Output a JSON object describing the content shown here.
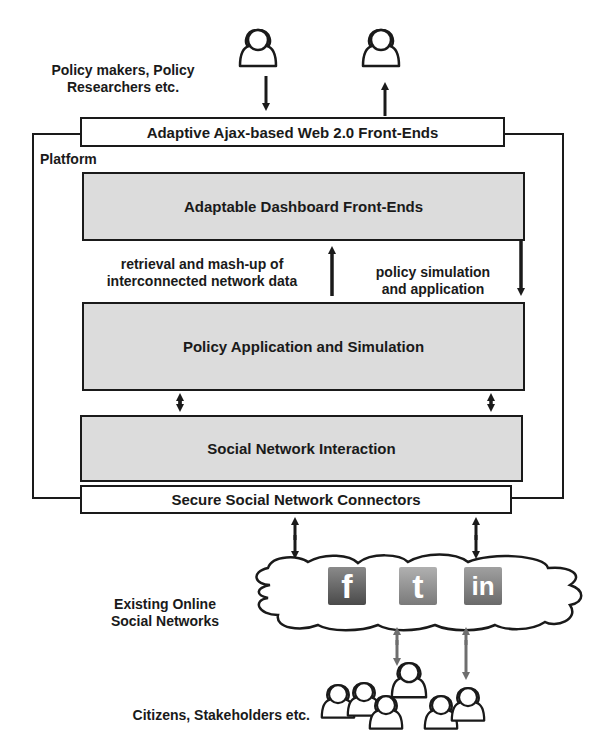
{
  "actors": {
    "top_label": "Policy makers, Policy\nResearchers etc.",
    "top_label_line1": "Policy makers, Policy",
    "top_label_line2": "Researchers etc.",
    "bottom_label": "Citizens, Stakeholders etc."
  },
  "boxes": {
    "web_frontends": "Adaptive Ajax-based Web 2.0 Front-Ends",
    "platform_label": "Platform",
    "dashboard": "Adaptable Dashboard Front-Ends",
    "policy_app": "Policy Application and Simulation",
    "social_interaction": "Social Network Interaction",
    "connectors": "Secure Social Network Connectors"
  },
  "flows": {
    "retrieval_line1": "retrieval and mash-up of",
    "retrieval_line2": "interconnected network data",
    "simulation_line1": "policy simulation",
    "simulation_line2": "and application"
  },
  "networks": {
    "label_line1": "Existing Online",
    "label_line2": "Social Networks",
    "logos": [
      {
        "name": "facebook",
        "glyph": "f"
      },
      {
        "name": "twitter",
        "glyph": "t"
      },
      {
        "name": "linkedin",
        "glyph": "in"
      }
    ]
  },
  "colors": {
    "stroke": "#1a1a1a",
    "box_fill": "#dcdcdc",
    "grey_arrow": "#6e6e6e"
  }
}
